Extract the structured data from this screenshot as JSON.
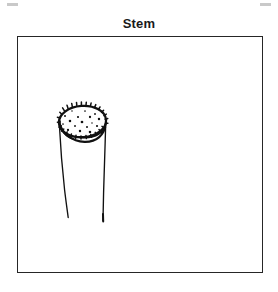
{
  "figure": {
    "caption": "Stem",
    "caption_color": "#1a1a1a",
    "frame": {
      "x": 17,
      "y": 36,
      "width": 246,
      "height": 237,
      "border_color": "#262626",
      "border_width": 1,
      "background": "#ffffff"
    },
    "artifacts": {
      "crop_mark_color": "#c9c9c9",
      "crop_mark_left_label": "crop-mark-left",
      "crop_mark_right_label": "crop-mark-right"
    }
  },
  "illustration": {
    "subject": "stem",
    "style": "hand-drawn ink line drawing, black on white",
    "ink_color": "#111111",
    "fill_color": "#ffffff",
    "description": "A cut plant stem shown as a cylinder: a speckled elliptical cut surface on top with two long slightly wavy vertical lines forming the sides of the stem below it.",
    "cut_surface": {
      "name": "stem-cross-section-ellipse",
      "center_x": 80,
      "center_y": 85,
      "radius_x": 24,
      "radius_y": 16,
      "outline_weight": 2.1,
      "texture": "speckled dots",
      "dot_count": 17,
      "dot_color": "#111111",
      "dot_radius": 1.0
    },
    "side_lines": [
      {
        "name": "stem-left-edge-line",
        "start_x": 41,
        "start_y": 92,
        "end_x": 50,
        "end_y": 180,
        "weight": 1.3
      },
      {
        "name": "stem-right-edge-line",
        "start_x": 87,
        "start_y": 92,
        "end_x": 85,
        "end_y": 184,
        "weight": 1.3
      }
    ],
    "dots": [
      [
        70,
        74
      ],
      [
        83,
        74
      ],
      [
        93,
        77
      ],
      [
        63,
        79
      ],
      [
        76,
        80
      ],
      [
        88,
        80
      ],
      [
        97,
        82
      ],
      [
        68,
        84
      ],
      [
        80,
        85
      ],
      [
        90,
        86
      ],
      [
        61,
        87
      ],
      [
        73,
        89
      ],
      [
        85,
        90
      ],
      [
        95,
        89
      ],
      [
        66,
        93
      ],
      [
        78,
        94
      ],
      [
        88,
        95
      ]
    ]
  }
}
